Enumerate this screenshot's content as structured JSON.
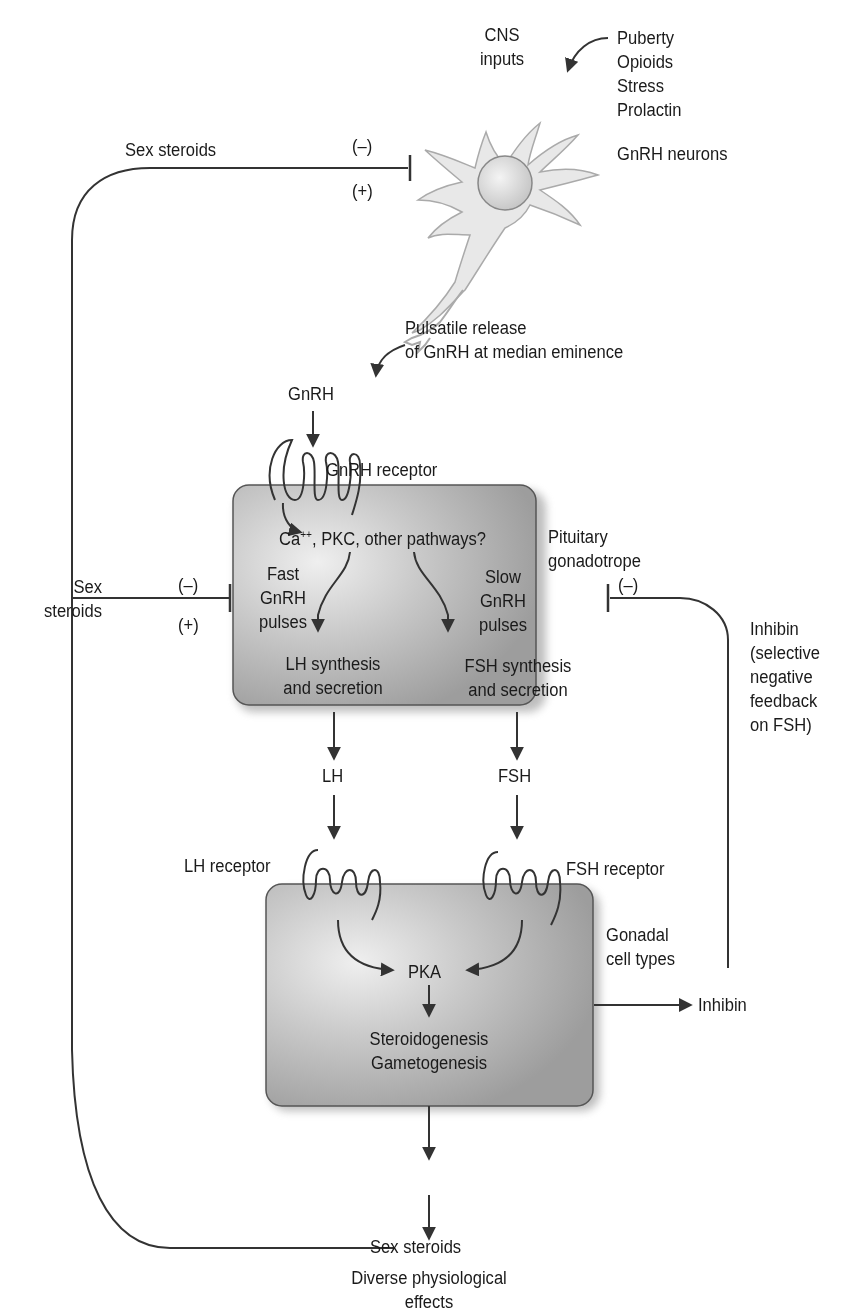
{
  "colors": {
    "line": "#333333",
    "box_fill": "#b5b5b5",
    "box_highlight": "#ececec",
    "neuron_fill": "#e6e6e6",
    "neuron_edge": "#a8a8a8"
  },
  "neuron": {
    "cns_inputs": [
      "CNS",
      "inputs"
    ],
    "inputs_list": [
      "Puberty",
      "Opioids",
      "Stress",
      "Prolactin"
    ],
    "label": "GnRH neurons",
    "release": [
      "Pulsatile release",
      "of GnRH at median eminence"
    ]
  },
  "feedback_top": {
    "label": "Sex steroids",
    "minus": "(–)",
    "plus": "(+)"
  },
  "feedback_mid": {
    "label": [
      "Sex",
      "steroids"
    ],
    "minus": "(–)",
    "plus": "(+)"
  },
  "gnrh": {
    "label": "GnRH",
    "receptor": "GnRH receptor"
  },
  "pituitary": {
    "label": [
      "Pituitary",
      "gonadotrope"
    ],
    "pathways_prefix": "Ca",
    "pathways_sup": "++",
    "pathways_suffix": ", PKC, other pathways?",
    "fast": [
      "Fast",
      "GnRH",
      "pulses"
    ],
    "slow": [
      "Slow",
      "GnRH",
      "pulses"
    ],
    "lh_synth": [
      "LH synthesis",
      "and secretion"
    ],
    "fsh_synth": [
      "FSH synthesis",
      "and secretion"
    ]
  },
  "hormones": {
    "lh": "LH",
    "fsh": "FSH",
    "lh_receptor": "LH receptor",
    "fsh_receptor": "FSH receptor"
  },
  "inhibin_feedback": {
    "minus": "(–)",
    "label": [
      "Inhibin",
      "(selective",
      "negative",
      "feedback",
      "on FSH)"
    ]
  },
  "gonad": {
    "label": [
      "Gonadal",
      "cell types"
    ],
    "pka": "PKA",
    "outputs": [
      "Steroidogenesis",
      "Gametogenesis"
    ],
    "inhibin": "Inhibin"
  },
  "bottom": {
    "sex_steroids": "Sex steroids",
    "effects": [
      "Diverse physiological",
      "effects"
    ]
  }
}
